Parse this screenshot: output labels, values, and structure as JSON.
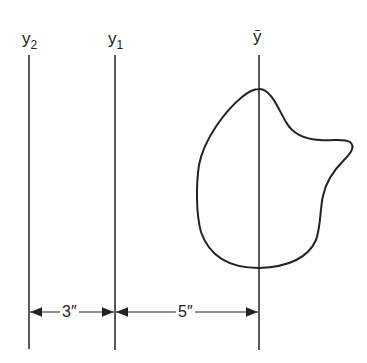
{
  "axes": [
    {
      "id": "y2",
      "base": "y",
      "sub": "2",
      "x": 29
    },
    {
      "id": "y1",
      "base": "y",
      "sub": "1",
      "x": 115
    },
    {
      "id": "ybar",
      "label": "ȳ",
      "x": 259
    }
  ],
  "dimensions": [
    {
      "label": "3″",
      "from": "y2",
      "to": "y1"
    },
    {
      "label": "5″",
      "from": "y1",
      "to": "ybar"
    }
  ],
  "colors": {
    "line": "#222222",
    "background": "#ffffff"
  }
}
